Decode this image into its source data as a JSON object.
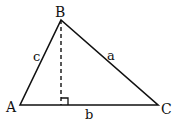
{
  "diagram": {
    "vertices": {
      "A": {
        "label": "A",
        "x": 20,
        "y": 105
      },
      "B": {
        "label": "B",
        "x": 61,
        "y": 20
      },
      "C": {
        "label": "C",
        "x": 158,
        "y": 105
      }
    },
    "sides": {
      "a": {
        "label": "a",
        "from": "B",
        "to": "C"
      },
      "b": {
        "label": "b",
        "from": "A",
        "to": "C"
      },
      "c": {
        "label": "c",
        "from": "A",
        "to": "B"
      }
    },
    "altitude": {
      "from": "B",
      "foot_x": 61,
      "foot_y": 105,
      "style": "dashed",
      "right_angle_marker": true
    },
    "colors": {
      "stroke": "#111111",
      "background": "#ffffff"
    }
  }
}
